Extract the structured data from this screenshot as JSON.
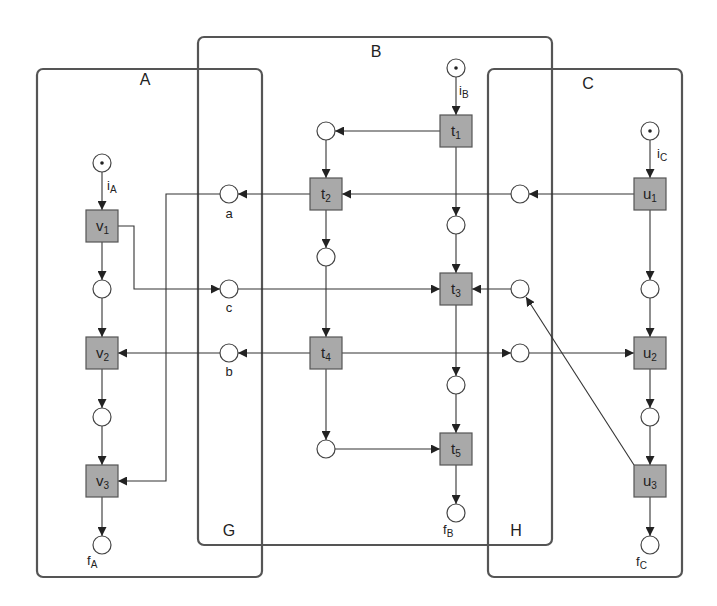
{
  "diagram": {
    "type": "petri-net-composition",
    "boxes": [
      {
        "id": "A",
        "label": "A"
      },
      {
        "id": "B",
        "label": "B"
      },
      {
        "id": "C",
        "label": "C"
      },
      {
        "id": "G",
        "label": "G"
      },
      {
        "id": "H",
        "label": "H"
      }
    ],
    "transitions": [
      {
        "id": "v1",
        "base": "v",
        "sub": "1"
      },
      {
        "id": "v2",
        "base": "v",
        "sub": "2"
      },
      {
        "id": "v3",
        "base": "v",
        "sub": "3"
      },
      {
        "id": "t1",
        "base": "t",
        "sub": "1"
      },
      {
        "id": "t2",
        "base": "t",
        "sub": "2"
      },
      {
        "id": "t3",
        "base": "t",
        "sub": "3"
      },
      {
        "id": "t4",
        "base": "t",
        "sub": "4"
      },
      {
        "id": "t5",
        "base": "t",
        "sub": "5"
      },
      {
        "id": "u1",
        "base": "u",
        "sub": "1"
      },
      {
        "id": "u2",
        "base": "u",
        "sub": "2"
      },
      {
        "id": "u3",
        "base": "u",
        "sub": "3"
      }
    ],
    "places": [
      {
        "id": "iA",
        "base": "i",
        "sub": "A",
        "marked": true
      },
      {
        "id": "fA",
        "base": "f",
        "sub": "A",
        "marked": false
      },
      {
        "id": "iB",
        "base": "i",
        "sub": "B",
        "marked": true
      },
      {
        "id": "fB",
        "base": "f",
        "sub": "B",
        "marked": false
      },
      {
        "id": "iC",
        "base": "i",
        "sub": "C",
        "marked": true
      },
      {
        "id": "fC",
        "base": "f",
        "sub": "C",
        "marked": false
      },
      {
        "id": "a",
        "label": "a"
      },
      {
        "id": "b",
        "label": "b"
      },
      {
        "id": "c",
        "label": "c"
      }
    ],
    "colors": {
      "transition_fill": "#a9a9a9",
      "box_stroke": "#555555",
      "arc_stroke": "#333333"
    }
  }
}
